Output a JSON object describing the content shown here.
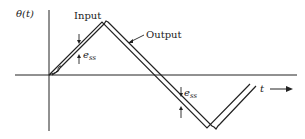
{
  "diagram": {
    "y_axis_label": "θ(t)",
    "x_axis_label": "t",
    "input_label": "Input",
    "output_label": "Output",
    "error_label_1": "e",
    "error_sub_1": "ss",
    "error_label_2": "e",
    "error_sub_2": "ss",
    "colors": {
      "line": "#222222",
      "background": "#ffffff"
    }
  }
}
